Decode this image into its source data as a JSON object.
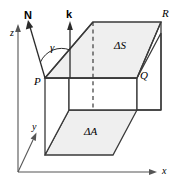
{
  "figure": {
    "type": "math-diagram",
    "colors": {
      "stroke": "#3a3a3a",
      "face_fill": "#efefef",
      "axis": "#555555",
      "text": "#000000"
    }
  },
  "axes": [
    {
      "name": "z-axis",
      "label": "z"
    },
    {
      "name": "y-axis",
      "label": "y"
    },
    {
      "name": "x-axis",
      "label": "x"
    }
  ],
  "vectors": [
    {
      "name": "normal-vector",
      "label": "N"
    },
    {
      "name": "unit-k-vector",
      "label": "k"
    }
  ],
  "angle": {
    "name": "gamma-angle",
    "label": "γ"
  },
  "points": [
    {
      "name": "point-P",
      "label": "P"
    },
    {
      "name": "point-Q",
      "label": "Q"
    },
    {
      "name": "point-R",
      "label": "R"
    }
  ],
  "faces": [
    {
      "name": "surface-element",
      "label": "ΔS"
    },
    {
      "name": "projected-area",
      "label": "ΔA"
    }
  ]
}
